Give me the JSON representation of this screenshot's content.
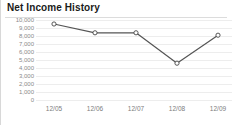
{
  "chart_data": {
    "type": "line",
    "title": "Net Income History",
    "xlabel": "",
    "ylabel": "",
    "categories": [
      "12/05",
      "12/06",
      "12/07",
      "12/08",
      "12/09"
    ],
    "values": [
      9500,
      8400,
      8400,
      4600,
      8100
    ],
    "series": [
      {
        "name": "Net Income",
        "values": [
          9500,
          8400,
          8400,
          4600,
          8100
        ]
      }
    ],
    "ylim": [
      0,
      10000
    ],
    "ytick_values": [
      10000,
      9000,
      8000,
      7000,
      6000,
      5000,
      4000,
      3000,
      2000,
      1000,
      0
    ],
    "ytick_labels": [
      "10,000",
      "9,000",
      "8,000",
      "7,000",
      "6,000",
      "5,000",
      "4,000",
      "3,000",
      "2,000",
      "1,000",
      "0"
    ],
    "grid": true,
    "legend": false,
    "legend_position": "none",
    "marker": "open-circle",
    "line_color": "#555555",
    "marker_fill": "#ffffff",
    "marker_stroke": "#444444",
    "grid_color": "#ededed",
    "axis_label_color": "#8a8a8a",
    "title_color": "#1a1a1a"
  }
}
